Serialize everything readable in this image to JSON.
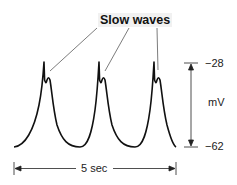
{
  "title": "Slow waves",
  "y_scale": {
    "top": "−28",
    "unit": "mV",
    "bottom": "−62"
  },
  "x_scale": {
    "label": "5 sec"
  },
  "colors": {
    "trace": "#111111",
    "text": "#222222"
  }
}
